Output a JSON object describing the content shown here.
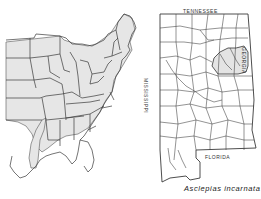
{
  "figure": {
    "caption": "Asclepias incarnata",
    "left_map": {
      "region": "Eastern United States",
      "shaded_range": "Eastern US excluding Deep South Gulf coast; isolated extension into Oklahoma/Texas"
    },
    "right_map": {
      "region": "Alabama counties",
      "labels": {
        "north": "TENNESSEE",
        "south": "FLORIDA",
        "west": "MISSISSIPPI",
        "east": "GEORGIA"
      },
      "shaded_area": "Northeastern Alabama counties near Georgia border"
    },
    "colors": {
      "shade": "#e4e4e4",
      "line": "#3a3a3a",
      "background": "#ffffff"
    }
  }
}
